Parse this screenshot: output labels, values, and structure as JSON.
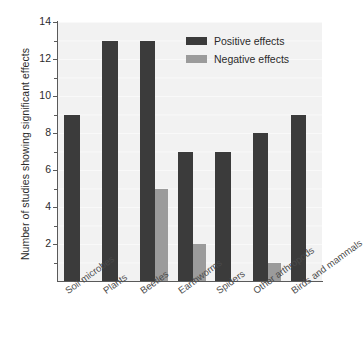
{
  "chart_data": {
    "type": "bar",
    "title": "",
    "xlabel": "",
    "ylabel": "Number of studies showing significant effects",
    "ylim": [
      0,
      14
    ],
    "y_ticks": [
      0,
      1,
      2,
      3,
      4,
      5,
      6,
      7,
      8,
      9,
      10,
      11,
      12,
      13,
      14
    ],
    "y_tick_labels": [
      "2",
      "4",
      "6",
      "8",
      "10",
      "12",
      "14"
    ],
    "y_tick_label_values": [
      2,
      4,
      6,
      8,
      10,
      12,
      14
    ],
    "grid": true,
    "legend_position": "top-right",
    "categories": [
      "Soil microbes",
      "Plants",
      "Beetles",
      "Earthworms",
      "Spiders",
      "Other arthropods",
      "Birds and mammals"
    ],
    "series": [
      {
        "name": "Positive effects",
        "color": "#3b3b3b",
        "values": [
          9,
          13,
          13,
          7,
          7,
          8,
          9
        ]
      },
      {
        "name": "Negative effects",
        "color": "#9b9b9b",
        "values": [
          0,
          0,
          5,
          2,
          0,
          1,
          0
        ]
      }
    ]
  },
  "legend": {
    "items": [
      {
        "label": "Positive effects",
        "swatch": "pos"
      },
      {
        "label": "Negative effects",
        "swatch": "neg"
      }
    ]
  },
  "colors": {
    "positive": "#3b3b3b",
    "negative": "#9b9b9b",
    "plot_background": "#f2f2f2",
    "axis": "#5a5a5a",
    "text": "#2b2b2b"
  }
}
